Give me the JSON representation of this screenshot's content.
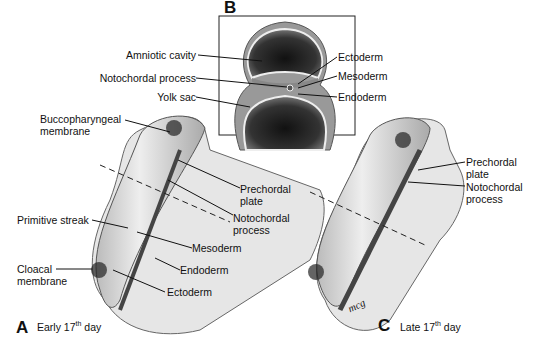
{
  "panels": {
    "A": {
      "letter": "A",
      "caption_pre": "Early 17",
      "caption_sup": "th",
      "caption_post": " day"
    },
    "B": {
      "letter": "B"
    },
    "C": {
      "letter": "C",
      "caption_pre": "Late 17",
      "caption_sup": "th",
      "caption_post": " day"
    }
  },
  "labels_B": {
    "amniotic_cavity": "Amniotic cavity",
    "notochordal_process": "Notochordal process",
    "yolk_sac": "Yolk sac",
    "ectoderm": "Ectoderm",
    "mesoderm": "Mesoderm",
    "endoderm": "Endoderm"
  },
  "labels_A": {
    "buccopharyngeal_1": "Buccopharyngeal",
    "buccopharyngeal_2": "membrane",
    "prechordal_1": "Prechordal",
    "prechordal_2": "plate",
    "notochordal_1": "Notochordal",
    "notochordal_2": "process",
    "primitive_streak": "Primitive streak",
    "mesoderm": "Mesoderm",
    "endoderm": "Endoderm",
    "cloacal_1": "Cloacal",
    "cloacal_2": "membrane",
    "ectoderm": "Ectoderm"
  },
  "labels_C": {
    "prechordal_1": "Prechordal",
    "prechordal_2": "plate",
    "notochordal_1": "Notochordal",
    "notochordal_2": "process"
  },
  "signature": "mcg"
}
